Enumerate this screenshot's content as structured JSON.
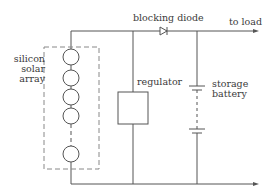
{
  "diagram": {
    "labels": {
      "solar_array": [
        "silicon",
        "solar",
        "array"
      ],
      "blocking_diode": "blocking diode",
      "to_load": "to load",
      "regulator": "regulator",
      "storage_battery": [
        "storage",
        "battery"
      ]
    },
    "components": [
      {
        "id": "solar-array",
        "type": "solar cell series",
        "cell_count_drawn": 5
      },
      {
        "id": "blocking-diode",
        "type": "diode"
      },
      {
        "id": "regulator",
        "type": "box"
      },
      {
        "id": "storage-battery",
        "type": "battery"
      },
      {
        "id": "load-output",
        "type": "arrow terminals"
      }
    ],
    "colors": {
      "line": "#555555",
      "dashed_box": "#888888",
      "text": "#3a3a3a"
    }
  }
}
